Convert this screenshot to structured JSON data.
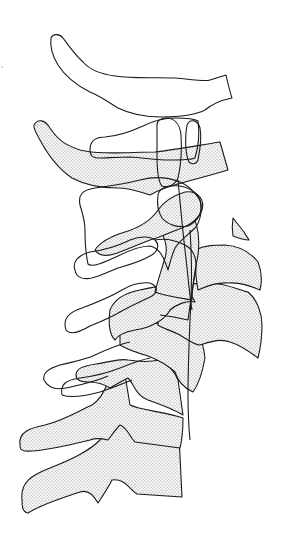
{
  "figure": {
    "type": "line drawing",
    "styles": {
      "outline_color": "#1a1a1a",
      "stipple_color": "#333333",
      "background": "#ffffff"
    },
    "layers": [
      {
        "name": "outline-tracing",
        "fill": "none"
      },
      {
        "name": "stippled-tracing",
        "fill": "dotted"
      }
    ]
  }
}
